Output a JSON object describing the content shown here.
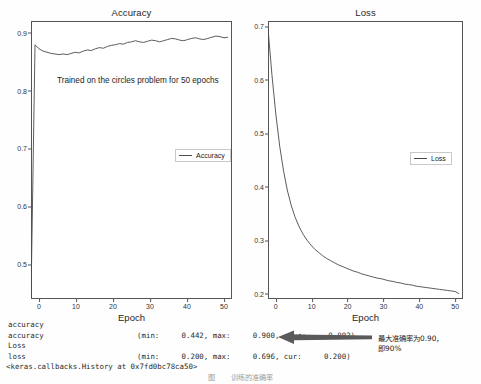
{
  "figure": {
    "accuracy_panel": {
      "title": "Accuracy",
      "xlabel": "Epoch",
      "yticks": [
        "0.5",
        "0.6",
        "0.7",
        "0.8",
        "0.9"
      ],
      "xticks": [
        "0",
        "10",
        "20",
        "30",
        "40",
        "50"
      ],
      "annotation": "Trained on the circles problem for 50 epochs",
      "legend": "Accuracy"
    },
    "loss_panel": {
      "title": "Loss",
      "xlabel": "Epoch",
      "yticks": [
        "0.2",
        "0.3",
        "0.4",
        "0.5",
        "0.6",
        "0.7"
      ],
      "xticks": [
        "0",
        "10",
        "20",
        "30",
        "40",
        "50"
      ],
      "legend": "Loss"
    }
  },
  "chart_data": [
    {
      "type": "line",
      "title": "Accuracy",
      "xlabel": "Epoch",
      "ylabel": "",
      "legend": [
        "Accuracy"
      ],
      "legend_position": "center-right",
      "grid": false,
      "xlim": [
        0,
        50
      ],
      "ylim": [
        0.44,
        0.92
      ],
      "xticks": [
        0,
        10,
        20,
        30,
        40,
        50
      ],
      "yticks": [
        0.5,
        0.6,
        0.7,
        0.8,
        0.9
      ],
      "annotations": [
        "Trained on the circles problem for 50 epochs"
      ],
      "series": [
        {
          "name": "Accuracy",
          "x": [
            0,
            1,
            2,
            3,
            4,
            5,
            6,
            7,
            8,
            9,
            10,
            11,
            12,
            13,
            14,
            15,
            16,
            17,
            18,
            19,
            20,
            21,
            22,
            23,
            24,
            25,
            26,
            27,
            28,
            29,
            30,
            31,
            32,
            33,
            34,
            35,
            36,
            37,
            38,
            39,
            40,
            41,
            42,
            43,
            44,
            45,
            46,
            47,
            48,
            49
          ],
          "values": [
            0.442,
            0.879,
            0.872,
            0.868,
            0.866,
            0.864,
            0.863,
            0.862,
            0.863,
            0.862,
            0.864,
            0.866,
            0.865,
            0.868,
            0.87,
            0.869,
            0.872,
            0.874,
            0.873,
            0.876,
            0.878,
            0.879,
            0.881,
            0.88,
            0.883,
            0.884,
            0.886,
            0.884,
            0.883,
            0.885,
            0.887,
            0.886,
            0.884,
            0.886,
            0.888,
            0.89,
            0.889,
            0.887,
            0.886,
            0.888,
            0.89,
            0.891,
            0.889,
            0.888,
            0.89,
            0.892,
            0.894,
            0.893,
            0.891,
            0.892
          ]
        }
      ]
    },
    {
      "type": "line",
      "title": "Loss",
      "xlabel": "Epoch",
      "ylabel": "",
      "legend": [
        "Loss"
      ],
      "legend_position": "center-right",
      "grid": false,
      "xlim": [
        0,
        50
      ],
      "ylim": [
        0.19,
        0.71
      ],
      "xticks": [
        0,
        10,
        20,
        30,
        40,
        50
      ],
      "yticks": [
        0.2,
        0.3,
        0.4,
        0.5,
        0.6,
        0.7
      ],
      "series": [
        {
          "name": "Loss",
          "x": [
            0,
            1,
            2,
            3,
            4,
            5,
            6,
            7,
            8,
            9,
            10,
            11,
            12,
            13,
            14,
            15,
            16,
            17,
            18,
            19,
            20,
            21,
            22,
            23,
            24,
            25,
            26,
            27,
            28,
            29,
            30,
            31,
            32,
            33,
            34,
            35,
            36,
            37,
            38,
            39,
            40,
            41,
            42,
            43,
            44,
            45,
            46,
            47,
            48,
            49
          ],
          "values": [
            0.696,
            0.61,
            0.536,
            0.476,
            0.429,
            0.392,
            0.364,
            0.342,
            0.325,
            0.311,
            0.3,
            0.291,
            0.283,
            0.277,
            0.271,
            0.266,
            0.262,
            0.258,
            0.254,
            0.251,
            0.248,
            0.245,
            0.242,
            0.24,
            0.237,
            0.235,
            0.233,
            0.231,
            0.229,
            0.228,
            0.226,
            0.224,
            0.223,
            0.221,
            0.22,
            0.218,
            0.217,
            0.216,
            0.214,
            0.213,
            0.212,
            0.211,
            0.21,
            0.209,
            0.208,
            0.207,
            0.206,
            0.205,
            0.204,
            0.2
          ]
        }
      ]
    }
  ],
  "console": {
    "line1": "accuracy",
    "line2": "accuracy                     (min:     0.442, max:     0.900,  cur:     0.892)",
    "line3": "Loss",
    "line4": "loss                         (min:     0.200, max:     0.696, cur:     0.200)",
    "line5": "<keras.callbacks.History at 0x7fd0bc78ca50>",
    "metrics": {
      "accuracy_min": "0.442",
      "accuracy_max": "0.900",
      "accuracy_cur": "0.892",
      "loss_min": "0.200",
      "loss_max": "0.696",
      "loss_cur": "0.200"
    }
  },
  "annotation_cjk": {
    "line1": "最大准确率为0.90，",
    "line2": "即90%"
  },
  "caption": "图 　　训练的准确率　　　　　　　　　　　　　　　　　　　　　　　　",
  "colors": {
    "line": "#4a4a4a",
    "frame": "#555555",
    "text": "#1b1b1b",
    "arrow": "#5a5a5a",
    "background": "#ffffff"
  }
}
